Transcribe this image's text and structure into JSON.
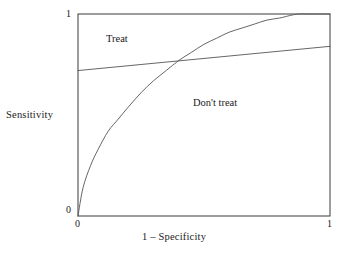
{
  "figure": {
    "background_color": "#ffffff",
    "frame_color": "#3a3a3a",
    "curve_color": "#555555"
  },
  "axes": {
    "xlabel": "1 – Specificity",
    "ylabel": "Sensitivity",
    "x_ticks": [
      "0",
      "1"
    ],
    "y_ticks": [
      "0",
      "1"
    ]
  },
  "annotations": {
    "treat": "Treat",
    "dont_treat": "Don't treat"
  },
  "chart_data": {
    "type": "line",
    "title": "",
    "xlabel": "1 – Specificity",
    "ylabel": "Sensitivity",
    "xlim": [
      0,
      1
    ],
    "ylim": [
      0,
      1
    ],
    "xticks": [
      0,
      1
    ],
    "yticks": [
      0,
      1
    ],
    "xticklabels": [
      "0",
      "1"
    ],
    "yticklabels": [
      "0",
      "1"
    ],
    "grid": false,
    "legend": "none",
    "frame": "full-box",
    "series": [
      {
        "name": "ROC curve",
        "style": "solid",
        "color": "#555555",
        "x": [
          0.0,
          0.02,
          0.05,
          0.08,
          0.12,
          0.16,
          0.2,
          0.25,
          0.3,
          0.35,
          0.4,
          0.45,
          0.5,
          0.55,
          0.6,
          0.65,
          0.7,
          0.75,
          0.8,
          0.85,
          0.88,
          0.92,
          1.0
        ],
        "y": [
          0.0,
          0.14,
          0.25,
          0.33,
          0.42,
          0.48,
          0.54,
          0.61,
          0.67,
          0.72,
          0.77,
          0.81,
          0.85,
          0.88,
          0.91,
          0.93,
          0.95,
          0.97,
          0.98,
          0.995,
          1.0,
          1.0,
          1.0
        ]
      },
      {
        "name": "Indifference line",
        "style": "solid",
        "color": "#555555",
        "x": [
          0.0,
          1.0
        ],
        "y": [
          0.72,
          0.84
        ]
      }
    ],
    "annotations": [
      {
        "text": "Treat",
        "x": 0.2,
        "y": 0.88,
        "region": "above-indifference-line"
      },
      {
        "text": "Don't treat",
        "x": 0.55,
        "y": 0.56,
        "region": "below-indifference-line"
      }
    ],
    "intersection": {
      "x": 0.37,
      "y": 0.735
    }
  }
}
